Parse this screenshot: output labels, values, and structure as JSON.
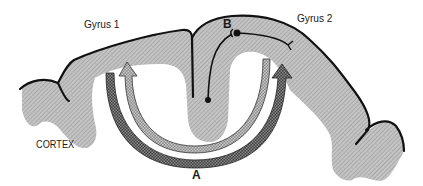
{
  "diagram": {
    "labels": {
      "gyrus1": "Gyrus 1",
      "gyrus2": "Gyrus 2",
      "point_a": "A",
      "point_b": "B",
      "cortex": "CORTEX"
    },
    "colors": {
      "cortex_fill": "#b8b8b8",
      "cortex_outline": "#111111",
      "outer_arrow": "#4a4a4a",
      "inner_arrow": "#9a9a9a",
      "neuron": "#111111",
      "background": "#ffffff"
    }
  }
}
